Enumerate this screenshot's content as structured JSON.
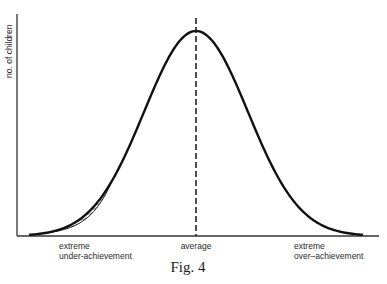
{
  "figure": {
    "caption": "Fig. 4",
    "y_axis_label": "no. of children",
    "x_labels": {
      "left_line1": "extreme",
      "left_line2": "under-achievement",
      "center": "average",
      "right_line1": "extreme",
      "right_line2": "over–achievement"
    },
    "ink_color": "#111111",
    "background_color": "#ffffff"
  },
  "chart_data": {
    "type": "line",
    "title": "Fig. 4",
    "xlabel": "",
    "ylabel": "no. of children",
    "x_ticks": [
      "extreme under-achievement",
      "average",
      "extreme over-achievement"
    ],
    "series": [
      {
        "name": "distribution",
        "shape": "normal",
        "mean": 0,
        "sd": 1,
        "xrange": [
          -3.2,
          3.2
        ]
      }
    ],
    "annotations": [
      {
        "type": "vline",
        "x": 0,
        "style": "dashed",
        "label": "average"
      },
      {
        "type": "hatched-region",
        "x_from": -3.0,
        "x_to": -1.6,
        "note": "area between main curve and a slightly lower curve in the under-achievement tail"
      }
    ],
    "grid": false,
    "legend": "none"
  }
}
